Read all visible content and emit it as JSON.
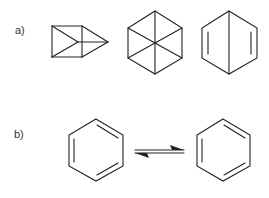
{
  "figure": {
    "panels": [
      {
        "label": "a)",
        "structures": [
          {
            "name": "prismane"
          },
          {
            "name": "benzvalene-like hexagon with three diagonals"
          },
          {
            "name": "dewar-benzene"
          }
        ]
      },
      {
        "label": "b)",
        "structures": [
          {
            "name": "kekule-benzene-1"
          },
          {
            "name": "kekule-benzene-2"
          }
        ],
        "connector": "equilibrium-arrows"
      }
    ],
    "colors": {
      "line": "#222222",
      "text": "#333333",
      "background": "#ffffff"
    }
  }
}
